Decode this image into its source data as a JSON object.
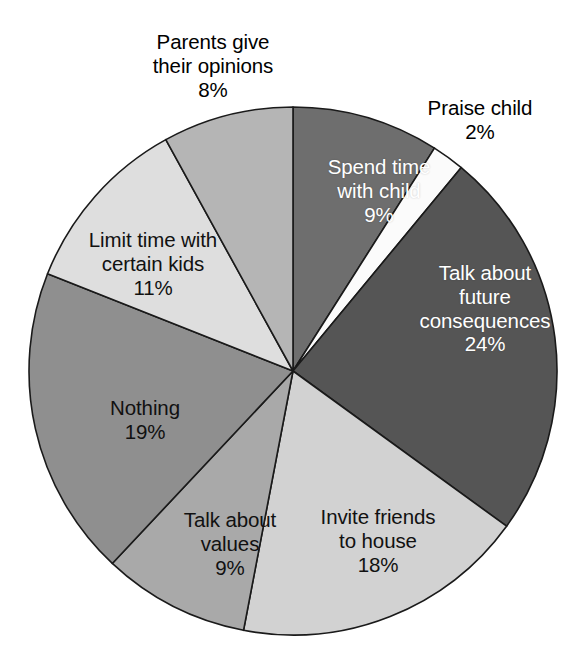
{
  "chart_data": {
    "type": "pie",
    "title": "",
    "subtitle": "",
    "xlabel": "",
    "ylabel": "",
    "legend_position": "none",
    "grid": false,
    "value_unit": "%",
    "start_angle_deg": 0,
    "direction": "clockwise",
    "categories": [
      "Spend time with child",
      "Praise child",
      "Talk about future consequences",
      "Invite friends to house",
      "Talk about values",
      "Nothing",
      "Limit time with certain kids",
      "Parents give their opinions"
    ],
    "values": [
      9,
      2,
      24,
      18,
      9,
      19,
      11,
      8
    ],
    "slices": [
      {
        "label": "Spend time with child",
        "label_line1": "Spend time",
        "label_line2": "with child",
        "value": 9,
        "value_text": "9%",
        "color": "#6e6e6e",
        "text_color": "#ffffff",
        "label_placement": "inside"
      },
      {
        "label": "Praise child",
        "label_line1": "Praise child",
        "label_line2": "",
        "value": 2,
        "value_text": "2%",
        "color": "#fbfbfb",
        "text_color": "#000000",
        "label_placement": "outside"
      },
      {
        "label": "Talk about future consequences",
        "label_line1": "Talk about",
        "label_line2": "future",
        "label_line3": "consequences",
        "value": 24,
        "value_text": "24%",
        "color": "#555555",
        "text_color": "#ffffff",
        "label_placement": "inside"
      },
      {
        "label": "Invite friends to house",
        "label_line1": "Invite friends",
        "label_line2": "to house",
        "value": 18,
        "value_text": "18%",
        "color": "#d2d2d2",
        "text_color": "#111111",
        "label_placement": "inside"
      },
      {
        "label": "Talk about values",
        "label_line1": "Talk about",
        "label_line2": "values",
        "value": 9,
        "value_text": "9%",
        "color": "#a9a9a9",
        "text_color": "#111111",
        "label_placement": "inside"
      },
      {
        "label": "Nothing",
        "label_line1": "Nothing",
        "label_line2": "",
        "value": 19,
        "value_text": "19%",
        "color": "#8f8f8f",
        "text_color": "#111111",
        "label_placement": "inside"
      },
      {
        "label": "Limit time with certain kids",
        "label_line1": "Limit time with",
        "label_line2": "certain kids",
        "value": 11,
        "value_text": "11%",
        "color": "#dedede",
        "text_color": "#111111",
        "label_placement": "inside"
      },
      {
        "label": "Parents give their opinions",
        "label_line1": "Parents give",
        "label_line2": "their opinions",
        "value": 8,
        "value_text": "8%",
        "color": "#b5b5b5",
        "text_color": "#000000",
        "label_placement": "outside"
      }
    ]
  },
  "labels": {
    "spend_time_with_child": {
      "line1": "Spend time",
      "line2": "with child",
      "value": "9%"
    },
    "praise_child": {
      "line1": "Praise child",
      "value": "2%"
    },
    "talk_future_consequences": {
      "line1": "Talk about",
      "line2": "future",
      "line3": "consequences",
      "value": "24%"
    },
    "invite_friends_to_house": {
      "line1": "Invite friends",
      "line2": "to house",
      "value": "18%"
    },
    "talk_about_values": {
      "line1": "Talk about",
      "line2": "values",
      "value": "9%"
    },
    "nothing": {
      "line1": "Nothing",
      "value": "19%"
    },
    "limit_time_certain_kids": {
      "line1": "Limit time with",
      "line2": "certain kids",
      "value": "11%"
    },
    "parents_give_opinions": {
      "line1": "Parents give",
      "line2": "their opinions",
      "value": "8%"
    }
  },
  "geometry": {
    "center_x": 293,
    "center_y": 371,
    "radius": 264
  }
}
